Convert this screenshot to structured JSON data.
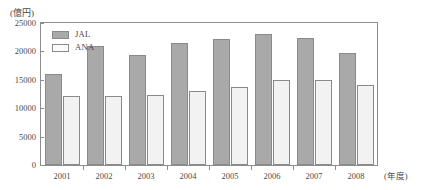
{
  "chart_data": {
    "type": "bar",
    "title": "",
    "subtitle": "",
    "xlabel": "(年度)",
    "ylabel": "(億円)",
    "categories": [
      "2001",
      "2002",
      "2003",
      "2004",
      "2005",
      "2006",
      "2007",
      "2008"
    ],
    "series": [
      {
        "name": "JAL",
        "color": "#a9a9a9",
        "values": [
          16100,
          20900,
          19400,
          21400,
          22100,
          23100,
          22400,
          19700
        ]
      },
      {
        "name": "ANA",
        "color": "#f2f2f2",
        "values": [
          12100,
          12200,
          12300,
          13000,
          13800,
          14900,
          14900,
          14100
        ]
      }
    ],
    "ylim": [
      0,
      25000
    ],
    "yticks": [
      0,
      5000,
      10000,
      15000,
      20000,
      25000
    ],
    "ytick_labels": [
      "0",
      "5000",
      "10000",
      "15000",
      "20000",
      "25000"
    ],
    "grid": false,
    "legend_position": "top-left"
  },
  "axes": {
    "y_unit_caption": "(億円)",
    "x_unit_caption": "(年度)"
  },
  "legend": {
    "entries": [
      {
        "label": "JAL",
        "swatch": "grey-filled-swatch"
      },
      {
        "label": "ANA",
        "swatch": "white-filled-swatch"
      }
    ]
  }
}
